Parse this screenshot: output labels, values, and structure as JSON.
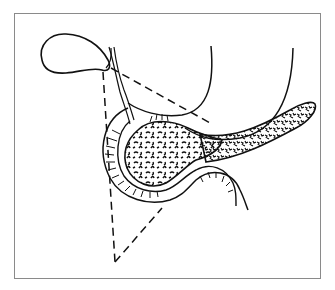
{
  "figure": {
    "type": "anatomical line illustration",
    "colors": {
      "ink": "#111111",
      "frame": "#8a8a8a",
      "background": "#ffffff"
    },
    "structures": [
      {
        "name": "gallbladder"
      },
      {
        "name": "cystic-and-common-bile-duct"
      },
      {
        "name": "stomach-outline"
      },
      {
        "name": "pancreas-head"
      },
      {
        "name": "pancreas-body-tail"
      },
      {
        "name": "duodenum"
      },
      {
        "name": "dashed-triangle"
      }
    ]
  }
}
